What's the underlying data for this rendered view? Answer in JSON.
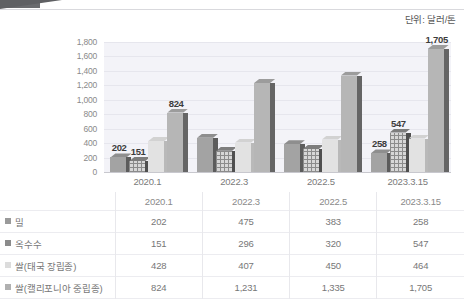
{
  "unit_caption": "단위: 달러/톤",
  "chart_data": {
    "type": "bar",
    "title": "",
    "subtitle": "",
    "xlabel": "",
    "ylabel": "",
    "ylim": [
      0,
      1800
    ],
    "ytick_step": 200,
    "ytick_labels": [
      "1,800",
      "1,600",
      "1,400",
      "1,200",
      "1,000",
      "800",
      "600",
      "400",
      "200",
      "0"
    ],
    "grid": true,
    "legend_position": "bottom-table",
    "unit": "달러/톤",
    "categories": [
      "2020.1",
      "2022.3",
      "2022.5",
      "2023.3.15"
    ],
    "series": [
      {
        "name": "밀",
        "color": "#a3a3a3",
        "values": [
          202,
          475,
          383,
          258
        ],
        "display_values": [
          "202",
          "475",
          "383",
          "258"
        ],
        "bar_labels": [
          "202",
          "",
          "",
          "258"
        ]
      },
      {
        "name": "옥수수",
        "color": "#8b8b8b",
        "values": [
          151,
          296,
          320,
          547
        ],
        "display_values": [
          "151",
          "296",
          "320",
          "547"
        ],
        "bar_labels": [
          "151",
          "",
          "",
          "547"
        ]
      },
      {
        "name": "쌀(태국 장립종)",
        "color": "#dcdcdc",
        "values": [
          428,
          407,
          450,
          464
        ],
        "display_values": [
          "428",
          "407",
          "450",
          "464"
        ],
        "bar_labels": [
          "",
          "",
          "",
          ""
        ]
      },
      {
        "name": "쌀(캘리포니아 중립종)",
        "color": "#b0b0b0",
        "values": [
          824,
          1231,
          1335,
          1705
        ],
        "display_values": [
          "824",
          "1,231",
          "1,335",
          "1,705"
        ],
        "bar_labels": [
          "824",
          "",
          "",
          "1,705"
        ]
      }
    ]
  },
  "table": {
    "corner_label": "",
    "column_headers": [
      "2020.1",
      "2022.3",
      "2022.5",
      "2023.3.15"
    ],
    "rows": [
      {
        "label": "밀",
        "values": [
          "202",
          "475",
          "383",
          "258"
        ]
      },
      {
        "label": "옥수수",
        "values": [
          "151",
          "296",
          "320",
          "547"
        ]
      },
      {
        "label": "쌀(태국 장립종)",
        "values": [
          "428",
          "407",
          "450",
          "464"
        ]
      },
      {
        "label": "쌀(캘리포니아 중립종)",
        "values": [
          "824",
          "1,231",
          "1,335",
          "1,705"
        ]
      }
    ]
  }
}
